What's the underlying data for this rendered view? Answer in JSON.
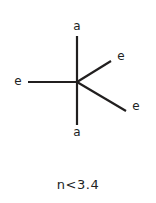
{
  "figure": {
    "background_color": "#ffffff",
    "stroke_color": "#211f1f",
    "text_color": "#211f1f",
    "caption": "n<3.4",
    "center": {
      "x": 77,
      "y": 82
    },
    "bonds": [
      {
        "id": "axial-top",
        "type": "axial",
        "label": "a",
        "direction": "up",
        "x1": 77,
        "y1": 82,
        "x2": 77,
        "y2": 36
      },
      {
        "id": "axial-bottom",
        "type": "axial",
        "label": "a",
        "direction": "down",
        "x1": 77,
        "y1": 82,
        "x2": 77,
        "y2": 125
      },
      {
        "id": "equatorial-left",
        "type": "equatorial",
        "label": "e",
        "direction": "left",
        "x1": 77,
        "y1": 82,
        "x2": 28,
        "y2": 82
      },
      {
        "id": "equatorial-upper-right",
        "type": "equatorial",
        "label": "e",
        "direction": "upper-right",
        "x1": 77,
        "y1": 82,
        "x2": 111,
        "y2": 61
      },
      {
        "id": "equatorial-lower-right",
        "type": "equatorial",
        "label": "e",
        "direction": "lower-right",
        "x1": 77,
        "y1": 82,
        "x2": 126,
        "y2": 111
      }
    ],
    "labels": {
      "axial_top": "a",
      "axial_bottom": "a",
      "equatorial_left": "e",
      "equatorial_upper_right": "e",
      "equatorial_lower_right": "e"
    }
  }
}
